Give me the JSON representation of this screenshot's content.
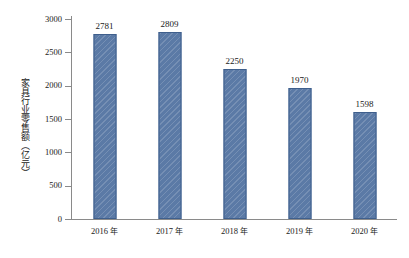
{
  "chart_data": {
    "type": "bar",
    "title": "",
    "subtitle": "",
    "xlabel": "",
    "ylabel": "家具行业零售额（亿元）",
    "categories": [
      "2016 年",
      "2017 年",
      "2018 年",
      "2019 年",
      "2020 年"
    ],
    "values": [
      2781,
      2809,
      2250,
      1970,
      1598
    ],
    "value_labels": [
      "2781",
      "2809",
      "2250",
      "1970",
      "1598"
    ],
    "ylim": [
      0,
      3000
    ],
    "ytick_values": [
      0,
      500,
      1000,
      1500,
      2000,
      2500,
      3000
    ],
    "ytick_labels": [
      "0",
      "500",
      "1000",
      "1500",
      "2000",
      "2500",
      "3000"
    ],
    "grid": false,
    "legend": null,
    "legend_position": "none",
    "series": [
      {
        "name": "家具行业零售额",
        "values": [
          2781,
          2809,
          2250,
          1970,
          1598
        ]
      }
    ]
  },
  "style": {
    "bar_fill": "#5b7aa6",
    "bar_border": "#3f5f8c",
    "axis_color": "#8a8a8a",
    "text_color": "#1a1a1a",
    "background": "#ffffff"
  }
}
